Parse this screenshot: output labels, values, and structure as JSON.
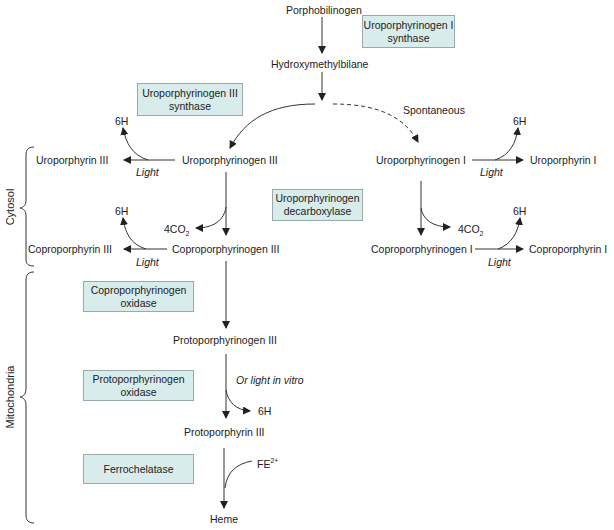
{
  "diagram": {
    "compounds": {
      "porphobilinogen": "Porphobilinogen",
      "hydroxymethylbilane": "Hydroxymethylbilane",
      "uroporphyrinogen_iii": "Uroporphyrinogen III",
      "uroporphyrin_iii": "Uroporphyrin III",
      "coproporphyrinogen_iii": "Coproporphyrinogen III",
      "coproporphyrin_iii": "Coproporphyrin III",
      "uroporphyrinogen_i": "Uroporphyrinogen I",
      "uroporphyrin_i": "Uroporphyrin I",
      "coproporphyrinogen_i": "Coproporphyrinogen I",
      "coproporphyrin_i": "Coproporphyrin I",
      "protoporphyrinogen_iii": "Protoporphyrinogen III",
      "protoporphyrin_iii": "Protoporphyrin III",
      "heme": "Heme"
    },
    "enzymes": {
      "uro_i_synthase": [
        "Uroporphyrinogen I",
        "synthase"
      ],
      "uro_iii_synthase": [
        "Uroporphyrinogen III",
        "synthase"
      ],
      "uro_decarboxylase": [
        "Uroporphyrinogen",
        "decarboxylase"
      ],
      "copro_oxidase": [
        "Coproporphyrinogen",
        "oxidase"
      ],
      "proto_oxidase": [
        "Protoporphyrinogen",
        "oxidase"
      ],
      "ferrochelatase": [
        "Ferrochelatase"
      ]
    },
    "labels": {
      "spontaneous": "Spontaneous",
      "light": "Light",
      "or_light_in_vitro": "Or light in vitro",
      "six_h": "6H",
      "four_co2_prefix": "4CO",
      "four_co2_sub": "2",
      "fe_prefix": "FE",
      "fe_sup": "2+"
    },
    "compartments": {
      "cytosol": "Cytosol",
      "mitochondria": "Mitochondria"
    },
    "colors": {
      "enzyme_box_fill": "#d8ecec",
      "enzyme_box_border": "#9aa9a9",
      "line": "#333333"
    }
  }
}
